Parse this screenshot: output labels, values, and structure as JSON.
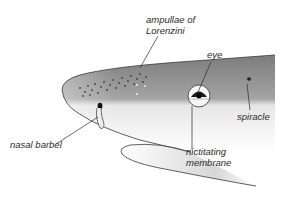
{
  "diagram": {
    "labels": {
      "ampullae_line1": "ampullae of",
      "ampullae_line2": "Lorenzini",
      "eye": "eye",
      "spiracle": "spiracle",
      "nasal_barbel": "nasal barbel",
      "nictitating_line1": "nictitating",
      "nictitating_line2": "membrane"
    },
    "colors": {
      "background": "#ffffff",
      "body_dark": "#8a8a8a",
      "body_light": "#f4f4f4",
      "outline": "#3a3a3a",
      "text": "#2b2b2b"
    }
  }
}
